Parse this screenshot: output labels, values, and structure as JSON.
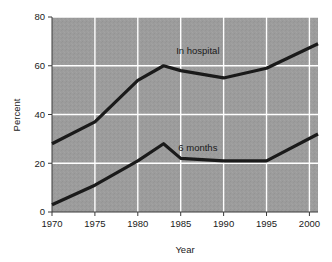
{
  "chart_data": {
    "type": "line",
    "title": "",
    "subtitle": "",
    "xlabel": "Year",
    "ylabel": "Percent",
    "xlim": [
      1970,
      2001
    ],
    "ylim": [
      0,
      80
    ],
    "xticks": [
      "1970",
      "1975",
      "1980",
      "1985",
      "1990",
      "1995",
      "2000"
    ],
    "xtick_values": [
      1970,
      1975,
      1980,
      1985,
      1990,
      1995,
      2000
    ],
    "yticks": [
      "0",
      "20",
      "40",
      "60",
      "80"
    ],
    "ytick_values": [
      0,
      20,
      40,
      60,
      80
    ],
    "grid": "both-white",
    "legend_position": "inline-annotation",
    "plot_background": "#9a9a9a",
    "gridline_color": "#ffffff",
    "line_color": "#1a1a1a",
    "series": [
      {
        "name": "In hospital",
        "label": "In hospital",
        "label_x": 1987,
        "label_y": 65,
        "x": [
          1970,
          1975,
          1980,
          1983,
          1985,
          1990,
          1995,
          2001
        ],
        "values": [
          28,
          37,
          54,
          60,
          58,
          55,
          59,
          69
        ]
      },
      {
        "name": "6 months",
        "label": "6 months",
        "label_x": 1987,
        "label_y": 25,
        "x": [
          1970,
          1975,
          1980,
          1983,
          1985,
          1990,
          1995,
          2001
        ],
        "values": [
          3,
          11,
          21,
          28,
          22,
          21,
          21,
          32
        ]
      }
    ]
  }
}
